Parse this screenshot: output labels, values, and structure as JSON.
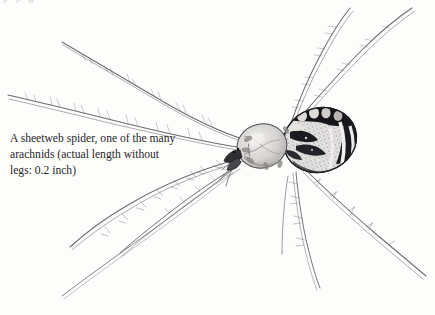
{
  "page": {
    "background_color": "#fdfdfb",
    "width": 435,
    "height": 315,
    "cut_off_text_above": "p   p    g"
  },
  "caption": {
    "full_text": "A sheetweb spider, one of the many arachnids (actual length without legs: 0.2 inch)",
    "lines": [
      "A sheetweb spider, one of the many",
      "arachnids (actual length without",
      "legs: 0.2 inch)"
    ],
    "text_color": "#27262a"
  },
  "illustration": {
    "subject": "sheetweb-spider",
    "technique": "pen-and-ink stipple line drawing",
    "actual_length_without_legs": "0.2 inch",
    "ink_color": "#5a5a5e",
    "abdomen_dark_color": "#17171a",
    "cephalothorax_color": "#d2d0cf",
    "parts": [
      {
        "name": "abdomen",
        "description": "oval, dark blotches with pale radiating stripes"
      },
      {
        "name": "cephalothorax",
        "description": "rounded pale shield"
      },
      {
        "name": "chelicerae",
        "description": "dark mouthparts at front"
      },
      {
        "name": "pedipalps",
        "description": "short appendages near head"
      },
      {
        "name": "legs",
        "description": "eight long slender legs with bristles"
      }
    ],
    "leg_count": 8
  }
}
